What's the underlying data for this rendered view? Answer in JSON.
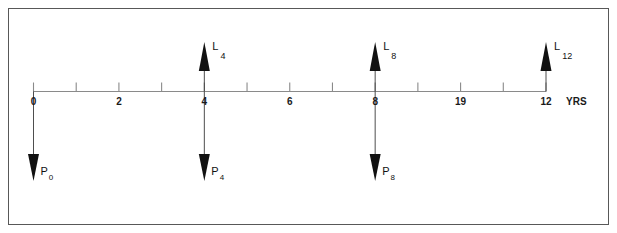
{
  "figure": {
    "frame_color": "#585858",
    "axis_color": "#8a8a8a",
    "arrow_color": "#111111",
    "background": "#ffffff"
  },
  "axis": {
    "name": "time-axis",
    "unit_label": "YRS",
    "min": 0,
    "max": 12,
    "tick_step": 1,
    "labeled_ticks": [
      {
        "value": 0,
        "label": "0"
      },
      {
        "value": 2,
        "label": "2"
      },
      {
        "value": 4,
        "label": "4"
      },
      {
        "value": 6,
        "label": "6"
      },
      {
        "value": 8,
        "label": "8"
      },
      {
        "value": 10,
        "label": "19"
      },
      {
        "value": 12,
        "label": "12"
      }
    ]
  },
  "chart_data": {
    "type": "line",
    "xlabel": "YRS",
    "ylabel": "",
    "xlim": [
      0,
      12
    ],
    "grid": false,
    "legend": "none",
    "x_ticks": [
      0,
      1,
      2,
      3,
      4,
      5,
      6,
      7,
      8,
      9,
      10,
      11,
      12
    ],
    "x_tick_labels": [
      "0",
      "",
      "2",
      "",
      "4",
      "",
      "6",
      "",
      "8",
      "",
      "19",
      "",
      "12"
    ],
    "series": [
      {
        "name": "inflows",
        "direction": "up",
        "marker": "solid-triangle",
        "points": [
          {
            "x": 4,
            "label_main": "L",
            "label_sub": "4"
          },
          {
            "x": 8,
            "label_main": "L",
            "label_sub": "8"
          },
          {
            "x": 12,
            "label_main": "L",
            "label_sub": "12"
          }
        ]
      },
      {
        "name": "outflows",
        "direction": "down",
        "marker": "solid-triangle",
        "points": [
          {
            "x": 0,
            "label_main": "P",
            "label_sub": "0"
          },
          {
            "x": 4,
            "label_main": "P",
            "label_sub": "4"
          },
          {
            "x": 8,
            "label_main": "P",
            "label_sub": "8"
          }
        ]
      }
    ]
  },
  "up_arrows": [
    {
      "name": "arrow-L4",
      "x_value": 4,
      "main": "L",
      "sub": "4"
    },
    {
      "name": "arrow-L8",
      "x_value": 8,
      "main": "L",
      "sub": "8"
    },
    {
      "name": "arrow-L12",
      "x_value": 12,
      "main": "L",
      "sub": "12"
    }
  ],
  "down_arrows": [
    {
      "name": "arrow-P0",
      "x_value": 0,
      "main": "P",
      "sub": "0"
    },
    {
      "name": "arrow-P4",
      "x_value": 4,
      "main": "P",
      "sub": "4"
    },
    {
      "name": "arrow-P8",
      "x_value": 8,
      "main": "P",
      "sub": "8"
    }
  ]
}
